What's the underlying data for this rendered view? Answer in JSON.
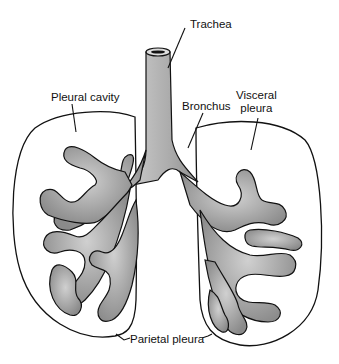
{
  "diagram": {
    "labels": {
      "trachea": "Trachea",
      "pleural_cavity": "Pleural cavity",
      "bronchus": "Bronchus",
      "visceral_pleura_line1": "Visceral",
      "visceral_pleura_line2": "pleura",
      "parietal_pleura": "Parietal pleura"
    },
    "colors": {
      "background": "#ffffff",
      "ink": "#111111",
      "tissue_fill": "#b8b8b8",
      "tissue_dark": "#7a7a7a"
    }
  }
}
